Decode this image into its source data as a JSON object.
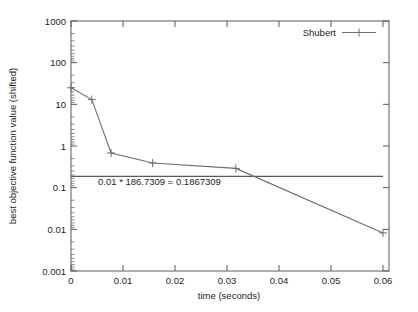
{
  "figure": {
    "background_color": "#ffffff",
    "frame_color": "#5a5a5a",
    "series_color": "#6e6e6e",
    "text_color": "#1c1c1c"
  },
  "chart_data": {
    "type": "line",
    "title": "",
    "xlabel": "time (seconds)",
    "ylabel": "best objective function value (shifted)",
    "xscale": "linear",
    "yscale": "log",
    "xlim": [
      0,
      0.06
    ],
    "ylim": [
      0.001,
      1000
    ],
    "grid": false,
    "legend_position": "top-right",
    "xticks": [
      0,
      0.01,
      0.02,
      0.03,
      0.04,
      0.05,
      0.06
    ],
    "xtick_labels": [
      "0",
      "0.01",
      "0.02",
      "0.03",
      "0.04",
      "0.05",
      "0.06"
    ],
    "yticks": [
      0.001,
      0.01,
      0.1,
      1,
      10,
      100,
      1000
    ],
    "ytick_labels": [
      "0.001",
      "0.01",
      "0.1",
      "1",
      "10",
      "100",
      "1000"
    ],
    "series": [
      {
        "name": "Shubert",
        "marker": "plus",
        "x": [
          0.0,
          0.004,
          0.0077,
          0.0157,
          0.0317,
          0.06
        ],
        "y": [
          25.0,
          13.0,
          0.68,
          0.39,
          0.29,
          0.0082
        ]
      },
      {
        "name": "threshold",
        "marker": "none",
        "x": [
          0.0,
          0.06
        ],
        "y": [
          0.1867309,
          0.1867309
        ]
      }
    ],
    "annotations": [
      {
        "text": "0.01 * 186.7309 = 0.1867309",
        "x": 0.0052,
        "y": 0.115
      }
    ]
  },
  "legend": {
    "entries": [
      {
        "label": "Shubert"
      }
    ]
  },
  "caption": {
    "partial_text": ""
  }
}
